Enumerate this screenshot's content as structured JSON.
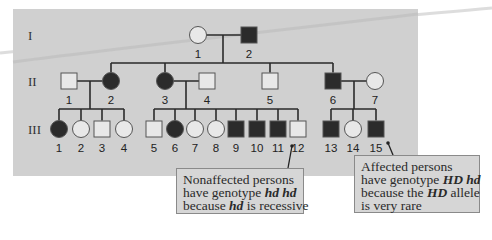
{
  "diagram": {
    "type": "pedigree",
    "panel_color": "#d0d0d0",
    "affected_color": "#2b2b2b",
    "unaffected_color": "#e8e8e8",
    "line_color": "#2a2a2a",
    "generations": [
      {
        "label": "I",
        "y": 35
      },
      {
        "label": "II",
        "y": 81
      },
      {
        "label": "III",
        "y": 129
      }
    ],
    "individuals": [
      {
        "id": "I-1",
        "gen": "I",
        "num": "1",
        "sex": "female",
        "affected": false,
        "x": 198,
        "y": 35
      },
      {
        "id": "I-2",
        "gen": "I",
        "num": "2",
        "sex": "male",
        "affected": true,
        "x": 249,
        "y": 35
      },
      {
        "id": "II-1",
        "gen": "II",
        "num": "1",
        "sex": "male",
        "affected": false,
        "x": 69,
        "y": 81
      },
      {
        "id": "II-2",
        "gen": "II",
        "num": "2",
        "sex": "female",
        "affected": true,
        "x": 111,
        "y": 81
      },
      {
        "id": "II-3",
        "gen": "II",
        "num": "3",
        "sex": "female",
        "affected": true,
        "x": 165,
        "y": 81
      },
      {
        "id": "II-4",
        "gen": "II",
        "num": "4",
        "sex": "male",
        "affected": false,
        "x": 207,
        "y": 81
      },
      {
        "id": "II-5",
        "gen": "II",
        "num": "5",
        "sex": "male",
        "affected": false,
        "x": 270,
        "y": 81
      },
      {
        "id": "II-6",
        "gen": "II",
        "num": "6",
        "sex": "male",
        "affected": true,
        "x": 333,
        "y": 81
      },
      {
        "id": "II-7",
        "gen": "II",
        "num": "7",
        "sex": "female",
        "affected": false,
        "x": 375,
        "y": 81
      },
      {
        "id": "III-1",
        "gen": "III",
        "num": "1",
        "sex": "female",
        "affected": true,
        "x": 59,
        "y": 129
      },
      {
        "id": "III-2",
        "gen": "III",
        "num": "2",
        "sex": "female",
        "affected": false,
        "x": 81,
        "y": 129
      },
      {
        "id": "III-3",
        "gen": "III",
        "num": "3",
        "sex": "male",
        "affected": false,
        "x": 102,
        "y": 129
      },
      {
        "id": "III-4",
        "gen": "III",
        "num": "4",
        "sex": "female",
        "affected": false,
        "x": 124,
        "y": 129
      },
      {
        "id": "III-5",
        "gen": "III",
        "num": "5",
        "sex": "male",
        "affected": false,
        "x": 154,
        "y": 129
      },
      {
        "id": "III-6",
        "gen": "III",
        "num": "6",
        "sex": "female",
        "affected": true,
        "x": 175,
        "y": 129
      },
      {
        "id": "III-7",
        "gen": "III",
        "num": "7",
        "sex": "female",
        "affected": false,
        "x": 195,
        "y": 129
      },
      {
        "id": "III-8",
        "gen": "III",
        "num": "8",
        "sex": "female",
        "affected": false,
        "x": 216,
        "y": 129
      },
      {
        "id": "III-9",
        "gen": "III",
        "num": "9",
        "sex": "male",
        "affected": true,
        "x": 236,
        "y": 129
      },
      {
        "id": "III-10",
        "gen": "III",
        "num": "10",
        "sex": "male",
        "affected": true,
        "x": 257,
        "y": 129
      },
      {
        "id": "III-11",
        "gen": "III",
        "num": "11",
        "sex": "male",
        "affected": true,
        "x": 278,
        "y": 129
      },
      {
        "id": "III-12",
        "gen": "III",
        "num": "12",
        "sex": "male",
        "affected": false,
        "x": 298,
        "y": 129
      },
      {
        "id": "III-13",
        "gen": "III",
        "num": "13",
        "sex": "male",
        "affected": true,
        "x": 331,
        "y": 129
      },
      {
        "id": "III-14",
        "gen": "III",
        "num": "14",
        "sex": "female",
        "affected": false,
        "x": 353,
        "y": 129
      },
      {
        "id": "III-15",
        "gen": "III",
        "num": "15",
        "sex": "male",
        "affected": true,
        "x": 376,
        "y": 129
      }
    ],
    "matings": [
      {
        "a": "I-1",
        "b": "I-2",
        "drop_x": 223,
        "sib_y": 63,
        "children_x": [
          111,
          165,
          270,
          333
        ]
      },
      {
        "a": "II-1",
        "b": "II-2",
        "drop_x": 90,
        "sib_y": 109,
        "children_x": [
          59,
          81,
          102,
          124
        ]
      },
      {
        "a": "II-3",
        "b": "II-4",
        "drop_x": 186,
        "sib_y": 109,
        "children_x": [
          154,
          175,
          195,
          216,
          236,
          257,
          278,
          298
        ]
      },
      {
        "a": "II-6",
        "b": "II-7",
        "drop_x": 354,
        "sib_y": 109,
        "children_x": [
          331,
          353,
          376
        ]
      }
    ],
    "callouts": [
      {
        "id": "nonaffected",
        "lines": [
          [
            {
              "t": "Nonaffected persons",
              "i": false
            }
          ],
          [
            {
              "t": "have genotype ",
              "i": false
            },
            {
              "t": "hd hd",
              "i": true
            }
          ],
          [
            {
              "t": "because ",
              "i": false
            },
            {
              "t": "hd",
              "i": true
            },
            {
              "t": " is recessive",
              "i": false
            }
          ]
        ],
        "points_to": "III-12",
        "pointer": {
          "x1": 288,
          "y1": 168,
          "x2": 292,
          "y2": 146
        }
      },
      {
        "id": "affected",
        "lines": [
          [
            {
              "t": "Affected persons",
              "i": false
            }
          ],
          [
            {
              "t": "have genotype ",
              "i": false
            },
            {
              "t": "HD hd",
              "i": true
            }
          ],
          [
            {
              "t": "because the ",
              "i": false
            },
            {
              "t": "HD",
              "i": true
            },
            {
              "t": " allele",
              "i": false
            }
          ],
          [
            {
              "t": "is very rare",
              "i": false
            }
          ]
        ],
        "points_to": "III-15",
        "pointer": {
          "x1": 393,
          "y1": 155,
          "x2": 388,
          "y2": 143
        }
      }
    ]
  }
}
